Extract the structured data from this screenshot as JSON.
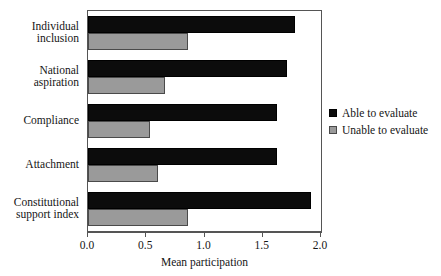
{
  "chart_data": {
    "type": "bar",
    "orientation": "horizontal",
    "title": "",
    "subtitle": "",
    "xlabel": "Mean participation",
    "ylabel": "",
    "xlim": [
      0.0,
      2.0
    ],
    "xticks": [
      0.0,
      0.5,
      1.0,
      1.5,
      2.0
    ],
    "xtick_labels": [
      "0.0",
      "0.5",
      "1.0",
      "1.5",
      "2.0"
    ],
    "grid": false,
    "legend_position": "right",
    "categories": [
      "Individual inclusion",
      "National aspiration",
      "Compliance",
      "Attachment",
      "Constitutional support index"
    ],
    "category_lines": [
      [
        "Individual",
        "inclusion"
      ],
      [
        "National",
        "aspiration"
      ],
      [
        "Compliance"
      ],
      [
        "Attachment"
      ],
      [
        "Constitutional",
        "support index"
      ]
    ],
    "series": [
      {
        "name": "Able to evaluate",
        "color": "#0c0c0c",
        "values": [
          1.78,
          1.71,
          1.62,
          1.62,
          1.91
        ]
      },
      {
        "name": "Unable to evaluate",
        "color": "#9a9a9a",
        "values": [
          0.86,
          0.66,
          0.53,
          0.6,
          0.86
        ]
      }
    ]
  },
  "legend": {
    "items": [
      {
        "label": "Able to evaluate",
        "swatch": "able"
      },
      {
        "label": "Unable to evaluate",
        "swatch": "unable"
      }
    ]
  },
  "colors": {
    "able": "#0c0c0c",
    "unable": "#9a9a9a",
    "axis": "#555555",
    "background": "#ffffff"
  }
}
